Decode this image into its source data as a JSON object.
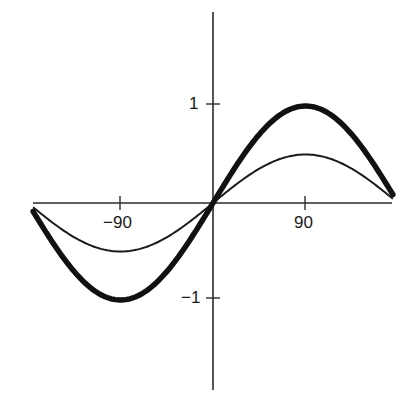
{
  "chart_data": {
    "type": "line",
    "title": "",
    "xlabel": "",
    "ylabel": "",
    "xlim": [
      -180,
      180
    ],
    "ylim": [
      -1.9,
      2.0
    ],
    "grid": false,
    "legend": null,
    "x_ticks": [
      {
        "value": -90,
        "label": "−90"
      },
      {
        "value": 90,
        "label": "90"
      }
    ],
    "y_ticks": [
      {
        "value": 1,
        "label": "1"
      },
      {
        "value": -1,
        "label": "−1"
      }
    ],
    "series": [
      {
        "name": "y = sin x",
        "style": "thick",
        "amplitude": 1,
        "x": [
          -180,
          -135,
          -90,
          -45,
          0,
          45,
          90,
          135,
          180
        ],
        "values": [
          0,
          -0.71,
          -1,
          -0.71,
          0,
          0.71,
          1,
          0.71,
          0
        ]
      },
      {
        "name": "y = 0.5 sin x",
        "style": "thin",
        "amplitude": 0.5,
        "x": [
          -180,
          -135,
          -90,
          -45,
          0,
          45,
          90,
          135,
          180
        ],
        "values": [
          0,
          -0.35,
          -0.5,
          -0.35,
          0,
          0.35,
          0.5,
          0.35,
          0
        ]
      }
    ]
  },
  "labels": {
    "y_pos1": "1",
    "y_neg1": "−1",
    "x_neg90": "−90",
    "x_pos90": "90"
  }
}
